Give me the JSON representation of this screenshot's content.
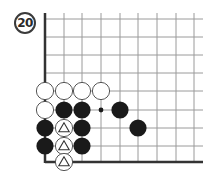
{
  "problem": {
    "number": "20"
  },
  "board": {
    "grid": {
      "x": [
        45,
        64,
        82,
        101,
        120,
        138,
        157,
        176,
        194
      ],
      "y": [
        19,
        37,
        55,
        73,
        91,
        110,
        128,
        146,
        162
      ],
      "right_extent": 203,
      "line_color": "#9a9a9a",
      "edge_color": "#333333",
      "edges": [
        "left",
        "bottom"
      ]
    },
    "stone_radius": 8.6,
    "colors": {
      "black": "#1a1a1a",
      "white_fill": "#ffffff",
      "white_stroke": "#444444"
    },
    "stones": [
      {
        "color": "white",
        "col": 0,
        "row": 4
      },
      {
        "color": "white",
        "col": 1,
        "row": 4
      },
      {
        "color": "white",
        "col": 2,
        "row": 4
      },
      {
        "color": "white",
        "col": 3,
        "row": 4
      },
      {
        "color": "white",
        "col": 0,
        "row": 5
      },
      {
        "color": "black",
        "col": 1,
        "row": 5
      },
      {
        "color": "black",
        "col": 2,
        "row": 5
      },
      {
        "color": "black",
        "col": 4,
        "row": 5
      },
      {
        "color": "black",
        "col": 0,
        "row": 6
      },
      {
        "color": "white",
        "col": 1,
        "row": 6,
        "mark": "triangle"
      },
      {
        "color": "black",
        "col": 2,
        "row": 6
      },
      {
        "color": "black",
        "col": 5,
        "row": 6
      },
      {
        "color": "black",
        "col": 0,
        "row": 7
      },
      {
        "color": "white",
        "col": 1,
        "row": 7,
        "mark": "triangle"
      },
      {
        "color": "black",
        "col": 2,
        "row": 7
      },
      {
        "color": "white",
        "col": 1,
        "row": 8,
        "mark": "triangle"
      }
    ],
    "markers": [
      {
        "type": "dot",
        "col": 3,
        "row": 5
      }
    ]
  }
}
